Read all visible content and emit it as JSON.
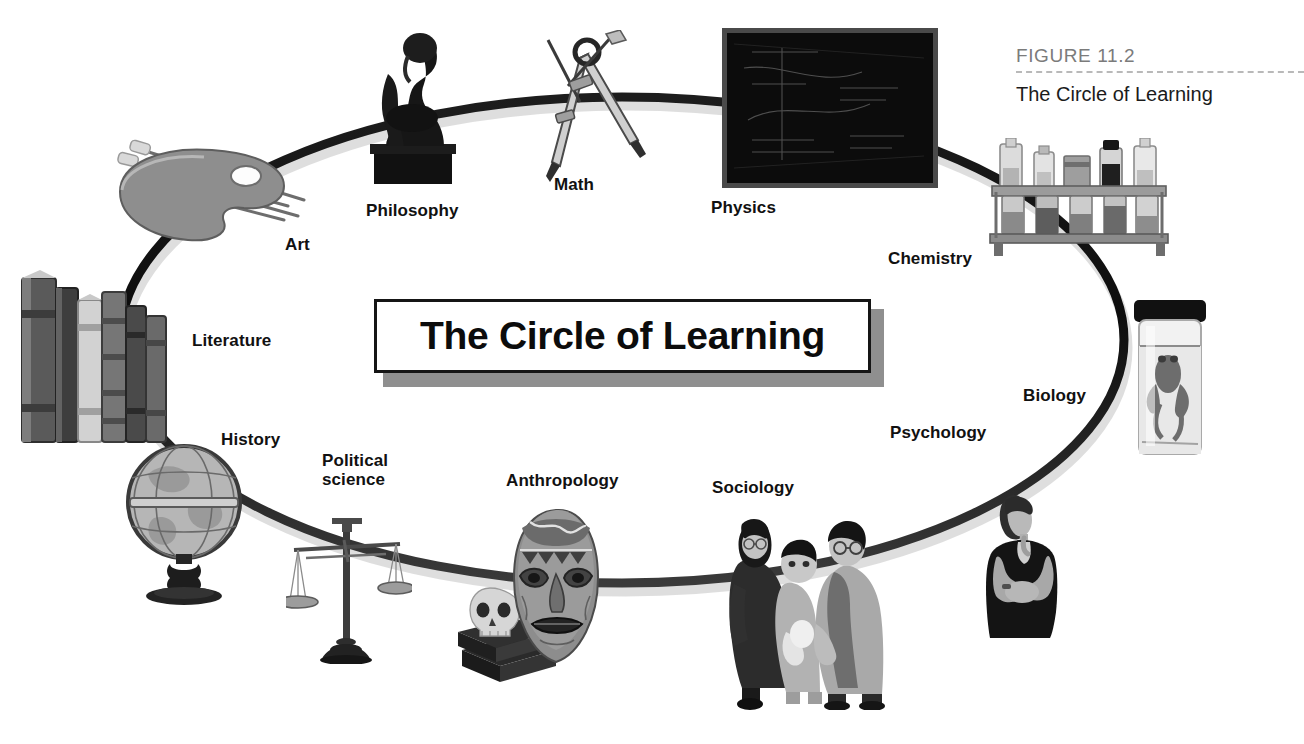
{
  "figure": {
    "number": "FIGURE 11.2",
    "caption": "The Circle of Learning"
  },
  "banner": {
    "title": "The Circle of Learning"
  },
  "diagram": {
    "type": "circle-of-learning",
    "shape": "ellipse-ring",
    "ring_color": "#111111",
    "background": "#ffffff",
    "node_count": 12,
    "nodes": [
      {
        "label": "Art",
        "icon": "paint-palette-with-brushes",
        "position": "upper-left"
      },
      {
        "label": "Philosophy",
        "icon": "thinker-statue",
        "position": "top-left"
      },
      {
        "label": "Math",
        "icon": "drawing-compass",
        "position": "top-center"
      },
      {
        "label": "Physics",
        "icon": "chalkboard",
        "position": "top-right"
      },
      {
        "label": "Chemistry",
        "icon": "test-tube-rack-with-bottles",
        "position": "upper-right"
      },
      {
        "label": "Biology",
        "icon": "frog-specimen-jar",
        "position": "right"
      },
      {
        "label": "Psychology",
        "icon": "thoughtful-woman",
        "position": "lower-right"
      },
      {
        "label": "Sociology",
        "icon": "family-portrait",
        "position": "bottom-right"
      },
      {
        "label": "Anthropology",
        "icon": "tribal-mask-and-skull",
        "position": "bottom-center"
      },
      {
        "label": "Political\nscience",
        "icon": "balance-scale",
        "position": "bottom-left"
      },
      {
        "label": "History",
        "icon": "world-globe",
        "position": "lower-left"
      },
      {
        "label": "Literature",
        "icon": "row-of-old-books",
        "position": "left"
      }
    ]
  },
  "colors": {
    "figure_number": "#7b7b7b",
    "rule": "#b9b9b9",
    "text": "#111111",
    "banner_shadow": "#8f8f8f"
  }
}
